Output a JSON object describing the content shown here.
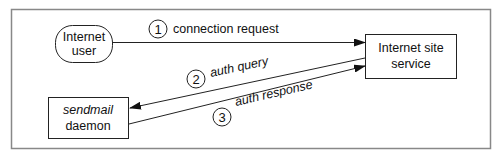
{
  "diagram": {
    "nodes": {
      "internet_user": {
        "line1": "Internet",
        "line2": "user",
        "shape": "rounded"
      },
      "internet_site": {
        "line1": "Internet site",
        "line2": "service",
        "shape": "rect"
      },
      "sendmail": {
        "line1": "sendmail",
        "line2": "daemon",
        "shape": "rect",
        "line1_style": "italic"
      }
    },
    "edges": [
      {
        "step": "1",
        "label": "connection request",
        "from": "Internet user",
        "to": "Internet site service"
      },
      {
        "step": "2",
        "label": "auth query",
        "from": "Internet site service",
        "to": "sendmail daemon"
      },
      {
        "step": "3",
        "label": "auth response",
        "from": "sendmail daemon",
        "to": "Internet site service"
      }
    ],
    "colors": {
      "line": "#222222",
      "frame": "#888888",
      "background": "#ffffff"
    }
  }
}
